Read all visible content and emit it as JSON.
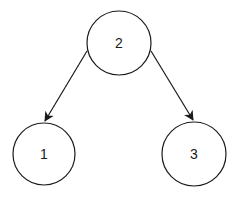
{
  "diagram": {
    "type": "binary-tree",
    "stroke_color": "#1a1a1a",
    "background": "#ffffff",
    "nodes": [
      {
        "id": "2",
        "label": "2",
        "cx": 119,
        "cy": 43,
        "r": 32
      },
      {
        "id": "1",
        "label": "1",
        "cx": 44,
        "cy": 154,
        "r": 31
      },
      {
        "id": "3",
        "label": "3",
        "cx": 194,
        "cy": 154,
        "r": 32
      }
    ],
    "edges": [
      {
        "from": "2",
        "to": "1",
        "x1": 87,
        "y1": 51,
        "x2": 45,
        "y2": 122
      },
      {
        "from": "2",
        "to": "3",
        "x1": 151,
        "y1": 51,
        "x2": 193,
        "y2": 121
      }
    ]
  }
}
